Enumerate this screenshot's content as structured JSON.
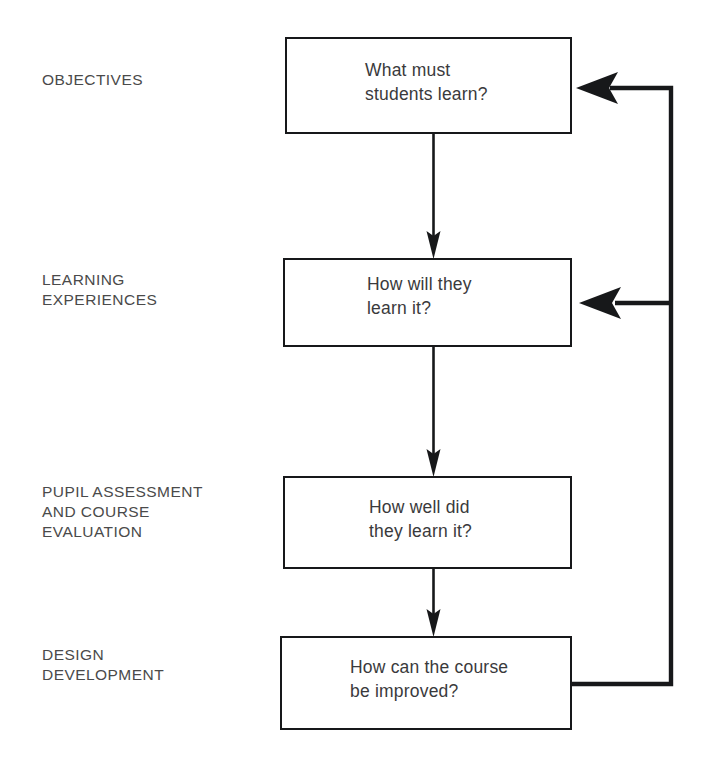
{
  "diagram": {
    "stroke_color": "#17181a",
    "text_color": "#3a3a3c",
    "label_color": "#4a4a4a",
    "background": "#ffffff",
    "stages": [
      {
        "id": "objectives",
        "label": "OBJECTIVES",
        "question": "What must\nstudents learn?",
        "label_x": 42,
        "label_y": 70,
        "box": {
          "x": 285,
          "y": 37,
          "w": 287,
          "h": 97
        },
        "text_x": 365,
        "text_y": 60
      },
      {
        "id": "learning-experiences",
        "label": "LEARNING\nEXPERIENCES",
        "question": "How will they\nlearn it?",
        "label_x": 42,
        "label_y": 270,
        "box": {
          "x": 283,
          "y": 258,
          "w": 289,
          "h": 89
        },
        "text_x": 367,
        "text_y": 272
      },
      {
        "id": "pupil-assessment",
        "label": "PUPIL ASSESSMENT\nAND COURSE\nEVALUATION",
        "question": "How well did\nthey learn it?",
        "label_x": 42,
        "label_y": 482,
        "box": {
          "x": 283,
          "y": 476,
          "w": 289,
          "h": 93
        },
        "text_x": 369,
        "text_y": 497
      },
      {
        "id": "design-development",
        "label": "DESIGN\nDEVELOPMENT",
        "question": "How can the course\nbe improved?",
        "label_x": 42,
        "label_y": 645,
        "box": {
          "x": 280,
          "y": 636,
          "w": 292,
          "h": 94
        },
        "text_x": 350,
        "text_y": 655
      }
    ],
    "connectors": [
      {
        "id": "objectives-to-learning",
        "type": "down-arrow",
        "x": 433,
        "from_y": 134,
        "to_y": 258
      },
      {
        "id": "learning-to-assessment",
        "type": "down-arrow",
        "x": 433,
        "from_y": 347,
        "to_y": 476
      },
      {
        "id": "assessment-to-design",
        "type": "down-arrow",
        "x": 433,
        "from_y": 569,
        "to_y": 636
      },
      {
        "id": "design-to-objectives-feedback",
        "type": "feedback-loop",
        "from_x": 572,
        "from_y": 684,
        "corner_x": 671,
        "to_y": 88,
        "arrow_tip_x": 575
      },
      {
        "id": "feedback-branch-to-learning",
        "type": "feedback-branch",
        "from_x": 671,
        "to_x": 578,
        "y": 303
      }
    ]
  }
}
